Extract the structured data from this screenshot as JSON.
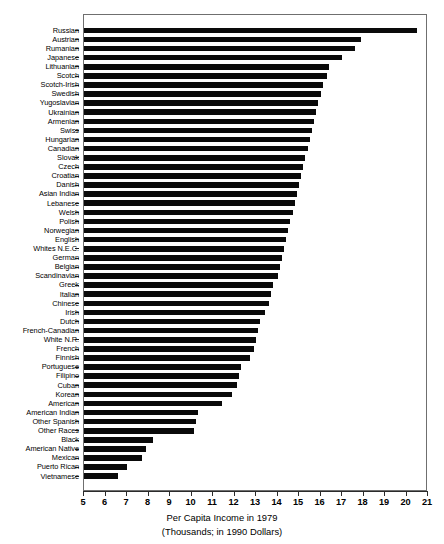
{
  "chart_data": {
    "type": "bar",
    "orientation": "horizontal",
    "title": "",
    "xlabel": "Per Capita Income in 1979",
    "xlabel_sub": "(Thousands; in 1990 Dollars)",
    "ylabel": "",
    "xlim": [
      5,
      21
    ],
    "xticks": [
      5,
      6,
      7,
      8,
      9,
      10,
      11,
      12,
      13,
      14,
      15,
      16,
      17,
      18,
      19,
      20,
      21
    ],
    "grid": false,
    "legend": null,
    "bar_color": "#0a0a0a",
    "categories": [
      "Russian",
      "Austrian",
      "Rumanian",
      "Japanese",
      "Lithuanian",
      "Scotch",
      "Scotch-Irish",
      "Swedish",
      "Yugoslavian",
      "Ukrainian",
      "Armenian",
      "Swiss",
      "Hungarian",
      "Canadian",
      "Slovak",
      "Czech",
      "Croatian",
      "Danish",
      "Asian Indian",
      "Lebanese",
      "Welsh",
      "Polish",
      "Norwegian",
      "English",
      "Whites N.E.C.",
      "German",
      "Belgian",
      "Scandinavian",
      "Greek",
      "Italian",
      "Chinese",
      "Irish",
      "Dutch",
      "French-Canadian",
      "White N.R.",
      "French",
      "Finnish",
      "Portuguese",
      "Filipino",
      "Cuban",
      "Korean",
      "American",
      "American Indian",
      "Other Spanish",
      "Other Races",
      "Black",
      "American Native",
      "Mexican",
      "Puerto Rican",
      "Vietnamese"
    ],
    "values": [
      20.5,
      17.9,
      17.6,
      17.0,
      16.4,
      16.3,
      16.1,
      16.0,
      15.9,
      15.8,
      15.7,
      15.6,
      15.5,
      15.4,
      15.3,
      15.2,
      15.1,
      15.0,
      14.9,
      14.8,
      14.7,
      14.6,
      14.5,
      14.4,
      14.3,
      14.2,
      14.1,
      14.0,
      13.8,
      13.7,
      13.6,
      13.4,
      13.2,
      13.1,
      13.0,
      12.9,
      12.7,
      12.3,
      12.2,
      12.1,
      11.9,
      11.4,
      10.3,
      10.2,
      10.1,
      8.2,
      7.9,
      7.7,
      7.0,
      6.6
    ]
  }
}
